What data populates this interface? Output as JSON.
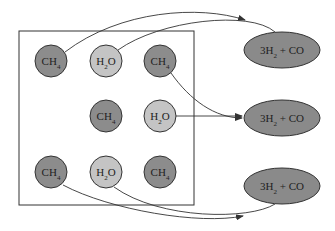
{
  "colors": {
    "ch4_fill": "#8c8c8c",
    "h2o_fill": "#c4c4c4",
    "product_fill": "#8a8a8a",
    "stroke": "#333333"
  },
  "molecules": [
    {
      "id": "m1",
      "label": "CH",
      "sub": "4",
      "type": "ch4",
      "cx": 51,
      "cy": 61
    },
    {
      "id": "m2",
      "label": "H",
      "sub": "2",
      "tail": "O",
      "type": "h2o",
      "cx": 106,
      "cy": 61
    },
    {
      "id": "m3",
      "label": "CH",
      "sub": "4",
      "type": "ch4",
      "cx": 160,
      "cy": 61
    },
    {
      "id": "m4",
      "label": "CH",
      "sub": "4",
      "type": "ch4",
      "cx": 106,
      "cy": 116
    },
    {
      "id": "m5",
      "label": "H",
      "sub": "2",
      "tail": "O",
      "type": "h2o",
      "cx": 160,
      "cy": 116
    },
    {
      "id": "m6",
      "label": "CH",
      "sub": "4",
      "type": "ch4",
      "cx": 51,
      "cy": 172
    },
    {
      "id": "m7",
      "label": "H",
      "sub": "2",
      "tail": "O",
      "type": "h2o",
      "cx": 106,
      "cy": 172
    },
    {
      "id": "m8",
      "label": "CH",
      "sub": "4",
      "type": "ch4",
      "cx": 160,
      "cy": 172
    }
  ],
  "products": [
    {
      "id": "p1",
      "label": "3H",
      "sub": "2",
      "tail": " + CO",
      "cx": 282,
      "cy": 50
    },
    {
      "id": "p2",
      "label": "3H",
      "sub": "2",
      "tail": " + CO",
      "cx": 282,
      "cy": 118
    },
    {
      "id": "p3",
      "label": "3H",
      "sub": "2",
      "tail": " + CO",
      "cx": 282,
      "cy": 186
    }
  ]
}
